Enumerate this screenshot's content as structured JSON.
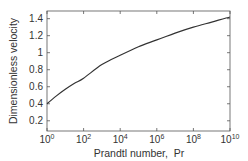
{
  "chart_data": {
    "type": "line",
    "title": "",
    "xlabel": "Prandtl number,  Pr",
    "ylabel": "Dimensionless velocity",
    "xscale": "log",
    "xlim_exp": [
      0,
      10
    ],
    "ylim": [
      0.08,
      1.49
    ],
    "x_ticks": [
      {
        "base": "10",
        "exp": "0",
        "e": 0
      },
      {
        "base": "10",
        "exp": "2",
        "e": 2
      },
      {
        "base": "10",
        "exp": "4",
        "e": 4
      },
      {
        "base": "10",
        "exp": "6",
        "e": 6
      },
      {
        "base": "10",
        "exp": "8",
        "e": 8
      },
      {
        "base": "10",
        "exp": "10",
        "e": 10
      }
    ],
    "y_ticks": [
      {
        "label": "0.2",
        "v": 0.2
      },
      {
        "label": "0.4",
        "v": 0.4
      },
      {
        "label": "0.6",
        "v": 0.6
      },
      {
        "label": "0.8",
        "v": 0.8
      },
      {
        "label": "1",
        "v": 1.0
      },
      {
        "label": "1.2",
        "v": 1.2
      },
      {
        "label": "1.4",
        "v": 1.4
      }
    ],
    "grid": false,
    "legend": null,
    "series": [
      {
        "name": "velocity",
        "x_exp": [
          0,
          0.5,
          1,
          1.5,
          2,
          3,
          4,
          5,
          6,
          7,
          8,
          9,
          10
        ],
        "values": [
          0.4,
          0.49,
          0.57,
          0.64,
          0.7,
          0.86,
          0.97,
          1.07,
          1.15,
          1.23,
          1.3,
          1.36,
          1.42
        ]
      }
    ]
  },
  "colors": {
    "line": "#333333",
    "axis": "#555555",
    "text": "#333333"
  }
}
